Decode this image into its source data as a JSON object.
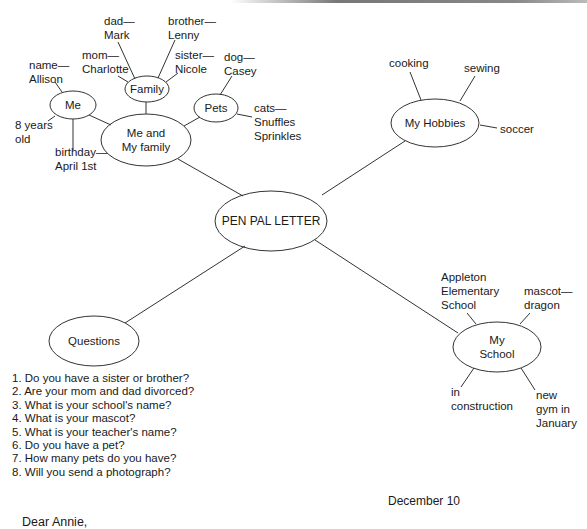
{
  "diagram": {
    "center": {
      "label": "PEN PAL LETTER"
    },
    "branches": [
      {
        "label_line1": "Me and",
        "label_line2": "My family",
        "children": [
          {
            "label": "Me",
            "details": [
              "name—\nAllison",
              "8 years\nold",
              "birthday—\nApril 1st"
            ]
          },
          {
            "label": "Family",
            "details": [
              "dad—\nMark",
              "brother—\nLenny",
              "mom—\nCharlotte",
              "sister—\nNicole"
            ]
          },
          {
            "label": "Pets",
            "details": [
              "dog—\nCasey",
              "cats—\nSnuffles\nSprinkles"
            ]
          }
        ]
      },
      {
        "label": "My Hobbies",
        "details": [
          "cooking",
          "sewing",
          "soccer"
        ]
      },
      {
        "label_line1": "My",
        "label_line2": "School",
        "details": [
          "Appleton\nElementary\nSchool",
          "mascot—\ndragon",
          "in\nconstruction",
          "new\ngym in\nJanuary"
        ]
      },
      {
        "label": "Questions"
      }
    ],
    "labels": {
      "me_name_1": "name—",
      "me_name_2": "Allison",
      "me_age_1": "8 years",
      "me_age_2": "old",
      "me_bday_1": "birthday—",
      "me_bday_2": "April 1st",
      "fam_dad_1": "dad—",
      "fam_dad_2": "Mark",
      "fam_bro_1": "brother—",
      "fam_bro_2": "Lenny",
      "fam_mom_1": "mom—",
      "fam_mom_2": "Charlotte",
      "fam_sis_1": "sister—",
      "fam_sis_2": "Nicole",
      "pet_dog_1": "dog—",
      "pet_dog_2": "Casey",
      "pet_cats_1": "cats—",
      "pet_cats_2": "Snuffles",
      "pet_cats_3": "Sprinkles",
      "hob_1": "cooking",
      "hob_2": "sewing",
      "hob_3": "soccer",
      "sch_name_1": "Appleton",
      "sch_name_2": "Elementary",
      "sch_name_3": "School",
      "sch_mascot_1": "mascot—",
      "sch_mascot_2": "dragon",
      "sch_con_1": "in",
      "sch_con_2": "construction",
      "sch_gym_1": "new",
      "sch_gym_2": "gym in",
      "sch_gym_3": "January"
    }
  },
  "questions": [
    "1. Do you have a sister or brother?",
    "2. Are your mom and dad divorced?",
    "3. What is your school's name?",
    "4. What is your mascot?",
    "5. What is your teacher's name?",
    "6. Do you have a pet?",
    "7. How many pets do you have?",
    "8. Will you send a photograph?"
  ],
  "letter": {
    "date": "December 10",
    "greeting": "Dear Annie,"
  },
  "colors": {
    "line": "#333333",
    "text": "#1a1a1a",
    "background": "#ffffff"
  }
}
